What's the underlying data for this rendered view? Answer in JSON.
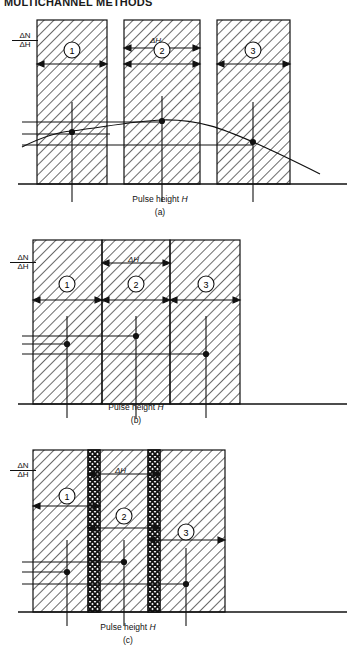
{
  "page": {
    "header_text": "MULTICHANNEL METHODS",
    "width": 359,
    "height": 672,
    "background": "#ffffff",
    "ink": "#111111"
  },
  "axis_label": {
    "numerator": "ΔN",
    "denominator": "ΔH"
  },
  "x_axis_label_prefix": "Pulse height ",
  "x_axis_label_symbol": "H",
  "band_labels": [
    "1",
    "2",
    "3"
  ],
  "delta_h_label": "ΔH",
  "panels": [
    {
      "id": "a",
      "caption": "(a)",
      "description": "Separated (non-contiguous) windows with gaps; differential spectrum curve overlaid",
      "has_curve": true,
      "band_style": "separated",
      "bands": [
        {
          "label": "1",
          "x0": 37,
          "x1": 107
        },
        {
          "label": "2",
          "x0": 124,
          "x1": 200
        },
        {
          "label": "3",
          "x0": 217,
          "x1": 290
        }
      ],
      "data_points": [
        {
          "band": "1",
          "x": 72,
          "y_level": 0.46
        },
        {
          "band": "2",
          "x": 162,
          "y_level": 0.56
        },
        {
          "band": "3",
          "x": 253,
          "y_level": 0.38
        }
      ]
    },
    {
      "id": "b",
      "caption": "(b)",
      "description": "Contiguous adjacent windows sharing boundaries",
      "has_curve": false,
      "band_style": "contiguous",
      "bands": [
        {
          "label": "1",
          "x0": 33,
          "x1": 102
        },
        {
          "label": "2",
          "x0": 102,
          "x1": 170
        },
        {
          "label": "3",
          "x0": 170,
          "x1": 240
        }
      ],
      "data_points": [
        {
          "band": "1",
          "x": 67,
          "y_level": 0.47
        },
        {
          "band": "2",
          "x": 136,
          "y_level": 0.55
        },
        {
          "band": "3",
          "x": 206,
          "y_level": 0.36
        }
      ]
    },
    {
      "id": "c",
      "caption": "(c)",
      "description": "Overlapping windows; cross-hatched regions mark the overlap zones",
      "has_curve": false,
      "band_style": "overlapping",
      "bands": [
        {
          "label": "1",
          "x0": 33,
          "x1": 100
        },
        {
          "label": "2",
          "x0": 88,
          "x1": 160
        },
        {
          "label": "3",
          "x0": 148,
          "x1": 225
        }
      ],
      "overlaps": [
        {
          "x0": 88,
          "x1": 100
        },
        {
          "x0": 148,
          "x1": 160
        }
      ],
      "data_points": [
        {
          "band": "1",
          "x": 67,
          "y_level": 0.46
        },
        {
          "band": "2",
          "x": 124,
          "y_level": 0.54
        },
        {
          "band": "3",
          "x": 186,
          "y_level": 0.35
        }
      ]
    }
  ]
}
